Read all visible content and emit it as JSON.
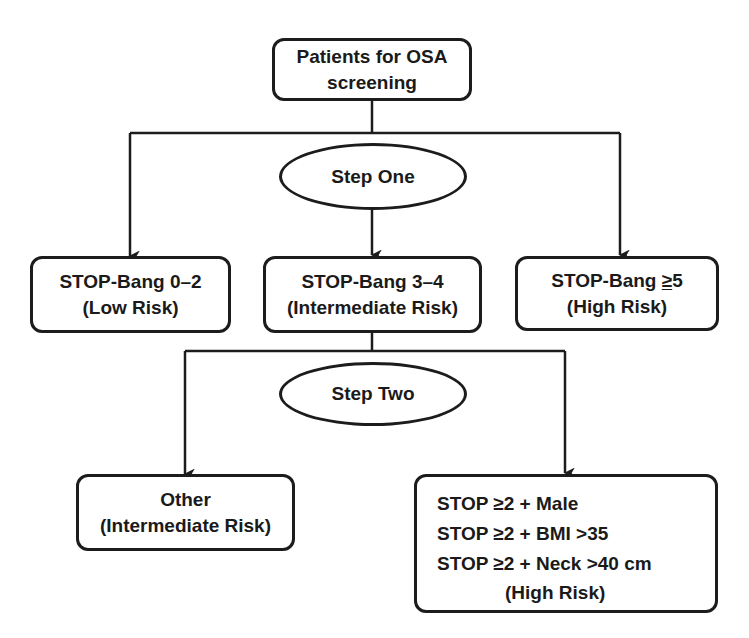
{
  "diagram": {
    "type": "flowchart",
    "colors": {
      "stroke": "#1c1c1c",
      "background": "#ffffff",
      "text": "#1a1a1a"
    },
    "root": {
      "line1": "Patients for OSA",
      "line2": "screening"
    },
    "step_one": {
      "label": "Step One"
    },
    "step_one_results": [
      {
        "title": "STOP-Bang 0–2",
        "risk": "(Low Risk)"
      },
      {
        "title": "STOP-Bang 3–4",
        "risk": "(Intermediate Risk)"
      },
      {
        "title_prefix": "STOP-Bang ",
        "title_symbol": "≥",
        "title_value": "5",
        "risk": "(High Risk)"
      }
    ],
    "step_two": {
      "label": "Step Two"
    },
    "step_two_results": {
      "other": {
        "title": "Other",
        "risk": "(Intermediate Risk)"
      },
      "high": {
        "criteria": [
          {
            "prefix": "STOP ",
            "symbol": "≥",
            "rest": "2 + Male"
          },
          {
            "prefix": "STOP ",
            "symbol": "≥",
            "rest": "2 + BMI >35"
          },
          {
            "prefix": "STOP ",
            "symbol": "≥",
            "rest": "2 + Neck >40 cm"
          }
        ],
        "risk": "(High Risk)"
      }
    }
  }
}
